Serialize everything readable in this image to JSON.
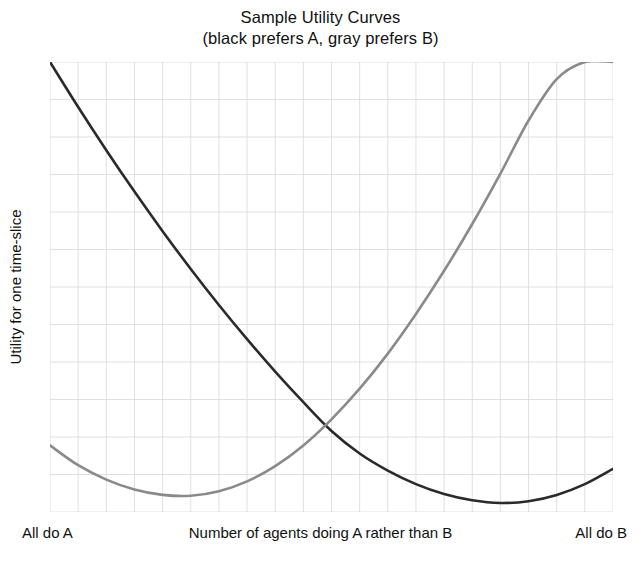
{
  "chart_data": {
    "type": "line",
    "title": "Sample Utility Curves",
    "subtitle": "(black prefers A, gray prefers B)",
    "xlabel": "Number of agents doing A rather than B",
    "ylabel": "Utility for one time-slice",
    "xlabel_left": "All do A",
    "xlabel_right": "All do B",
    "grid": true,
    "grid_color": "#d8d8d8",
    "grid_columns": 20,
    "grid_rows": 12,
    "axis_ticks_shown": false,
    "xlim": [
      0,
      1
    ],
    "ylim": [
      0,
      1
    ],
    "legend_position": "none",
    "series": [
      {
        "name": "black prefers A",
        "color": "#2a2a2a",
        "description": "Convex U-shaped utility curve, high at left (all do A is low x) falling to a minimum near the right, then rising slightly.",
        "x": [
          0.0,
          0.05,
          0.1,
          0.15,
          0.2,
          0.25,
          0.3,
          0.35,
          0.4,
          0.45,
          0.5,
          0.55,
          0.6,
          0.65,
          0.7,
          0.75,
          0.8,
          0.85,
          0.9,
          0.95,
          1.0
        ],
        "y": [
          1.0,
          0.9,
          0.804,
          0.712,
          0.624,
          0.54,
          0.46,
          0.384,
          0.312,
          0.244,
          0.18,
          0.13,
          0.092,
          0.062,
          0.04,
          0.026,
          0.02,
          0.024,
          0.038,
          0.062,
          0.096
        ]
      },
      {
        "name": "gray prefers B",
        "color": "#8a8a8a",
        "description": "Convex U-shaped utility curve, low at left with a shallow minimum near the left quarter, rising steeply to the top right.",
        "x": [
          0.0,
          0.05,
          0.1,
          0.15,
          0.2,
          0.25,
          0.3,
          0.35,
          0.4,
          0.45,
          0.5,
          0.55,
          0.6,
          0.65,
          0.7,
          0.75,
          0.8,
          0.85,
          0.9,
          0.95,
          1.0
        ],
        "y": [
          0.148,
          0.104,
          0.072,
          0.05,
          0.038,
          0.036,
          0.046,
          0.068,
          0.102,
          0.148,
          0.206,
          0.274,
          0.352,
          0.44,
          0.536,
          0.64,
          0.752,
          0.87,
          0.962,
          1.0,
          1.0
        ]
      }
    ],
    "annotations": [
      {
        "name": "crossing-point",
        "x": 0.5,
        "y": 0.15,
        "label": "curves intersect"
      },
      {
        "name": "black-minimum",
        "x": 0.8,
        "y": 0.02,
        "label": "black curve minimum"
      },
      {
        "name": "gray-minimum",
        "x": 0.24,
        "y": 0.036,
        "label": "gray curve minimum"
      }
    ]
  }
}
